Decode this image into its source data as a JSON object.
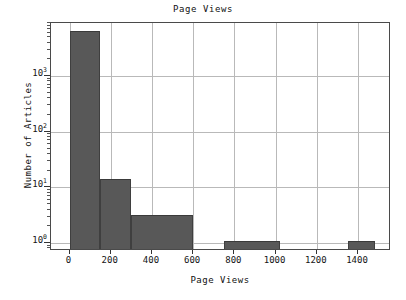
{
  "chart_data": {
    "type": "bar",
    "title": "Page Views",
    "xlabel": "Page Views",
    "ylabel": "Number of Articles",
    "yscale": "log",
    "xscale": "linear",
    "grid": true,
    "legend": null,
    "xlim": [
      -90,
      1560
    ],
    "ylim": [
      0.72,
      9000
    ],
    "xticks": [
      0,
      200,
      400,
      600,
      800,
      1000,
      1200,
      1400
    ],
    "xtick_labels": [
      "0",
      "200",
      "400",
      "600",
      "800",
      "1000",
      "1200",
      "1400"
    ],
    "yticks": [
      1,
      10,
      100,
      1000
    ],
    "ytick_labels": [
      "10",
      "10",
      "10",
      "10"
    ],
    "ytick_exponents": [
      "0",
      "1",
      "2",
      "3"
    ],
    "bars": [
      {
        "x_start": 0,
        "x_end": 150,
        "value": 6000
      },
      {
        "x_start": 150,
        "x_end": 300,
        "value": 13
      },
      {
        "x_start": 300,
        "x_end": 600,
        "value": 3
      },
      {
        "x_start": 750,
        "x_end": 1020,
        "value": 1
      },
      {
        "x_start": 1350,
        "x_end": 1480,
        "value": 1
      }
    ],
    "bar_color": "#585858",
    "grid_color": "#b9b9b9",
    "axis_color": "#4a4a4a",
    "background_color": "#ffffff"
  }
}
